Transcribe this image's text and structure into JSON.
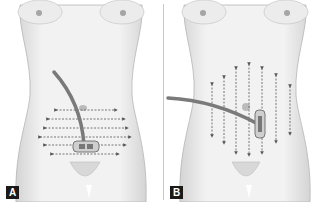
{
  "figure": {
    "panels": [
      {
        "id": "A",
        "label": "A",
        "arrow_direction": "horizontal",
        "tube_entry": "top-center",
        "device_position": "lower-abdomen-center"
      },
      {
        "id": "B",
        "label": "B",
        "arrow_direction": "vertical",
        "tube_entry": "left-flank",
        "device_position": "right-of-navel-vertical"
      }
    ],
    "colors": {
      "skin": "#efefef",
      "skin_shadow": "#c8c8c8",
      "outline": "#9a9a9a",
      "tube": "#7a7a7a",
      "arrow": "#6a6a6a",
      "label_bg": "#1a1a1a",
      "label_text": "#ffffff",
      "divider": "#c9c9c9"
    }
  }
}
